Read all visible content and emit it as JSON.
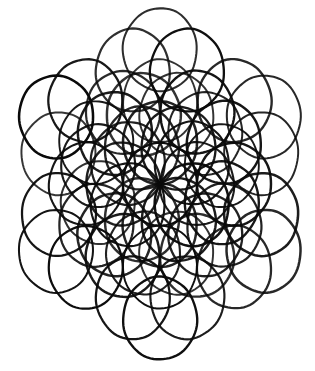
{
  "figure": {
    "title": "Twelve-fold circle rosette",
    "kind": "geometric-line-drawing",
    "medium": "hand-drawn ink on paper, photocopied",
    "canvas": {
      "width": 315,
      "height": 371
    },
    "background_color": "#ffffff",
    "ink_color": "#0a0a0a"
  },
  "chart_data": {
    "type": "diagram",
    "title": "Twelve-fold circle rosette",
    "symmetry_order": 12,
    "center": {
      "x": 160,
      "y": 184
    },
    "circle_radius": 37,
    "bounds": {
      "left": 18,
      "top": 8,
      "right": 300,
      "bottom": 362
    },
    "vertical_stretch": 1.12,
    "rings": [
      {
        "name": "hub",
        "count": 1,
        "radius": 0,
        "phase_deg": 0
      },
      {
        "name": "inner-ring",
        "count": 12,
        "radius": 37,
        "phase_deg": 0
      },
      {
        "name": "middle-ring",
        "count": 12,
        "radius": 64,
        "phase_deg": 15
      },
      {
        "name": "outer-ring",
        "count": 12,
        "radius": 74,
        "phase_deg": 0
      },
      {
        "name": "rim-ring",
        "count": 12,
        "radius": 105,
        "phase_deg": 15
      },
      {
        "name": "edge-ring",
        "count": 6,
        "radius": 120,
        "phase_deg": 0
      }
    ],
    "stroke_width": 2.2,
    "stroke_jitter": 0.55
  }
}
